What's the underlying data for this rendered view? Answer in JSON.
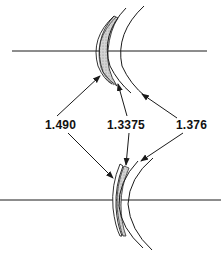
{
  "diagram": {
    "type": "contact-lens-refractive-index-diagram",
    "labels": {
      "lens": "1.490",
      "tear_layer": "1.3375",
      "cornea": "1.376"
    },
    "colors": {
      "line": "#1a1a1a",
      "tear_fill": "#c8c8c8",
      "background": "#ffffff"
    }
  }
}
